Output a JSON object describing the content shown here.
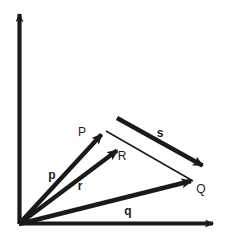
{
  "figure": {
    "background_color": "#ffffff",
    "ink_color": "#1a1a1a"
  },
  "axes": {
    "origin": {
      "x": 19,
      "y": 224
    },
    "x_axis": {
      "name": "x-axis",
      "from_x": 19,
      "from_y": 224,
      "to_x": 218,
      "to_y": 224
    },
    "y_axis": {
      "name": "y-axis",
      "from_x": 19,
      "from_y": 224,
      "to_x": 19,
      "to_y": 9
    }
  },
  "points": {
    "P": {
      "label": "P",
      "x": 105,
      "y": 130,
      "label_x": 82,
      "label_y": 136
    },
    "Q": {
      "label": "Q",
      "x": 196,
      "y": 182,
      "label_x": 199,
      "label_y": 192
    },
    "R": {
      "label": "R",
      "x": 121,
      "y": 146,
      "label_x": 120,
      "label_y": 159
    }
  },
  "vectors": [
    {
      "name": "p",
      "label": "p",
      "from_x": 19,
      "from_y": 224,
      "to_x": 105,
      "to_y": 130,
      "label_x": 52,
      "label_y": 178,
      "thick": true
    },
    {
      "name": "r",
      "label": "r",
      "from_x": 19,
      "from_y": 224,
      "to_x": 121,
      "to_y": 146,
      "label_x": 79,
      "label_y": 189,
      "thick": true
    },
    {
      "name": "q",
      "label": "q",
      "from_x": 19,
      "from_y": 224,
      "to_x": 196,
      "to_y": 182,
      "label_x": 127,
      "label_y": 214,
      "thick": true
    },
    {
      "name": "s",
      "label": "s",
      "from_x": 117,
      "from_y": 118,
      "to_x": 207,
      "to_y": 168,
      "label_x": 159,
      "label_y": 136,
      "thick": true
    }
  ],
  "connectors": [
    {
      "name": "p-to-q-connector",
      "from_x": 105,
      "from_y": 130,
      "to_x": 196,
      "to_y": 182
    }
  ]
}
